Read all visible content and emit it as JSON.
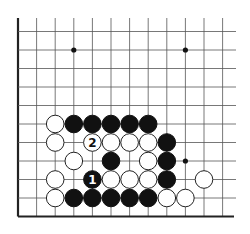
{
  "diagram": {
    "board": {
      "columns": 12,
      "rows": 10,
      "edges": [
        "left",
        "bottom"
      ],
      "star_points": [
        {
          "col": 3,
          "row": 1
        },
        {
          "col": 9,
          "row": 1
        },
        {
          "col": 9,
          "row": 7
        }
      ]
    },
    "stones": [
      {
        "color": "white",
        "col": 2,
        "row": 5
      },
      {
        "color": "black",
        "col": 3,
        "row": 5
      },
      {
        "color": "black",
        "col": 4,
        "row": 5
      },
      {
        "color": "black",
        "col": 5,
        "row": 5
      },
      {
        "color": "black",
        "col": 6,
        "row": 5
      },
      {
        "color": "black",
        "col": 7,
        "row": 5
      },
      {
        "color": "white",
        "col": 2,
        "row": 6
      },
      {
        "color": "white",
        "col": 4,
        "row": 6,
        "label": "2"
      },
      {
        "color": "white",
        "col": 5,
        "row": 6
      },
      {
        "color": "white",
        "col": 6,
        "row": 6
      },
      {
        "color": "white",
        "col": 7,
        "row": 6
      },
      {
        "color": "black",
        "col": 8,
        "row": 6
      },
      {
        "color": "white",
        "col": 3,
        "row": 7
      },
      {
        "color": "black",
        "col": 5,
        "row": 7
      },
      {
        "color": "white",
        "col": 7,
        "row": 7
      },
      {
        "color": "black",
        "col": 8,
        "row": 7
      },
      {
        "color": "white",
        "col": 2,
        "row": 8
      },
      {
        "color": "black",
        "col": 4,
        "row": 8,
        "label": "1"
      },
      {
        "color": "white",
        "col": 5,
        "row": 8
      },
      {
        "color": "white",
        "col": 6,
        "row": 8
      },
      {
        "color": "white",
        "col": 7,
        "row": 8
      },
      {
        "color": "black",
        "col": 8,
        "row": 8
      },
      {
        "color": "white",
        "col": 10,
        "row": 8
      },
      {
        "color": "white",
        "col": 2,
        "row": 9
      },
      {
        "color": "black",
        "col": 3,
        "row": 9
      },
      {
        "color": "black",
        "col": 4,
        "row": 9
      },
      {
        "color": "black",
        "col": 5,
        "row": 9
      },
      {
        "color": "black",
        "col": 6,
        "row": 9
      },
      {
        "color": "black",
        "col": 7,
        "row": 9
      },
      {
        "color": "white",
        "col": 8,
        "row": 9
      },
      {
        "color": "white",
        "col": 9,
        "row": 9
      }
    ]
  }
}
